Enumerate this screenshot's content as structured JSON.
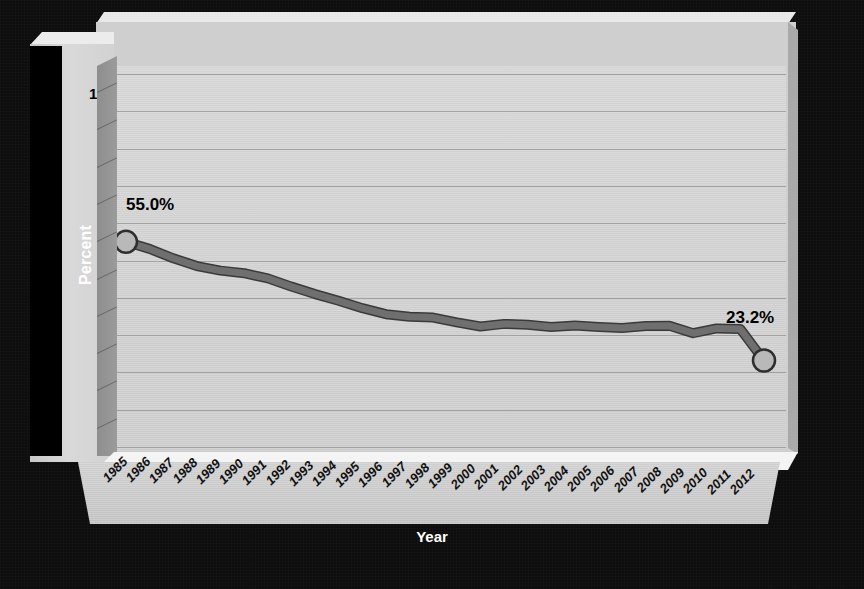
{
  "chart_data": {
    "type": "line",
    "title": "",
    "xlabel": "Year",
    "ylabel": "Percent",
    "ylim": [
      0,
      100
    ],
    "ytick_step": 10,
    "yticks": [
      100,
      90,
      80,
      70,
      60,
      50,
      40,
      30,
      20,
      10,
      0
    ],
    "grid": true,
    "legend": null,
    "legend_position": "none",
    "categories": [
      "1985",
      "1986",
      "1987",
      "1988",
      "1989",
      "1990",
      "1991",
      "1992",
      "1993",
      "1994",
      "1995",
      "1996",
      "1997",
      "1998",
      "1999",
      "2000",
      "2001",
      "2002",
      "2003",
      "2004",
      "2005",
      "2006",
      "2007",
      "2008",
      "2009",
      "2010",
      "2011",
      "2012"
    ],
    "series": [
      {
        "name": "Percent",
        "values": [
          55.0,
          53.1,
          50.6,
          48.5,
          47.3,
          46.6,
          45.2,
          43.0,
          41.0,
          39.2,
          37.2,
          35.6,
          34.9,
          34.7,
          33.4,
          32.3,
          33.0,
          32.8,
          32.2,
          32.6,
          32.2,
          31.9,
          32.4,
          32.5,
          30.5,
          31.8,
          31.6,
          23.2
        ]
      }
    ],
    "annotations": [
      {
        "text": "55.0%",
        "category": "1985",
        "value": 55.0
      },
      {
        "text": "23.2%",
        "category": "2012",
        "value": 23.2
      }
    ],
    "markers": [
      {
        "category": "1985",
        "value": 55.0
      },
      {
        "category": "2012",
        "value": 23.2
      }
    ],
    "style": {
      "line_color": "#6f6f6f",
      "line_edge_color": "#3a3a3a",
      "marker_fill": "#b9b9b9",
      "marker_edge": "#2e2e2e",
      "plot_background": "#d2d2d2",
      "grid_color": "#9a9a9a",
      "frame_background": "#0d0d0d",
      "axis_text_color": "#000000",
      "axis_title_color": "#ffffff"
    }
  },
  "axis": {
    "y_title": "Percent",
    "x_title": "Year"
  }
}
